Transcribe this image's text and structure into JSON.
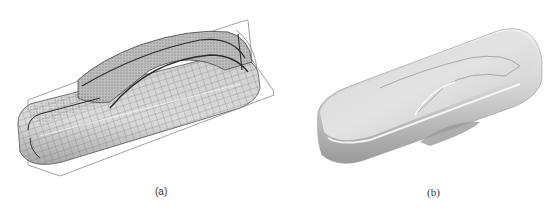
{
  "figure": {
    "panels": [
      {
        "label": "(a)",
        "description": "Wireframe/mesh car body model with bounding curves",
        "colors": {
          "surface": "#c8c8c8",
          "mesh": "#555555",
          "curve": "#2a2a2a",
          "bbox": "#8a8a8a"
        }
      },
      {
        "label": "(b)",
        "description": "Shaded smooth car body surface model",
        "colors": {
          "surface_light": "#e8e8e8",
          "surface_mid": "#c4c4c4",
          "surface_dark": "#8e8e8e"
        }
      }
    ]
  }
}
